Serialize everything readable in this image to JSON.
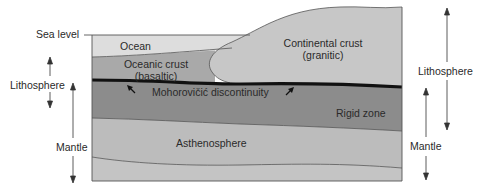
{
  "labels": {
    "sea_level": "Sea level",
    "ocean": "Ocean",
    "oceanic_crust_line1": "Oceanic crust",
    "oceanic_crust_line2": "(basaltic)",
    "continental_crust_line1": "Continental crust",
    "continental_crust_line2": "(granitic)",
    "moho": "Mohorovičić discontinuity",
    "rigid_zone": "Rigid zone",
    "asthenosphere": "Asthenosphere",
    "left_lithosphere": "Lithosphere",
    "left_mantle": "Mantle",
    "right_lithosphere": "Lithosphere",
    "right_mantle": "Mantle"
  },
  "colors": {
    "ocean": "#dcdcdc",
    "oceanic_crust": "#aaaaaa",
    "continental_crust": "#c6c6c6",
    "rigid_zone": "#8c8c8c",
    "asthenosphere": "#bdbdbd",
    "lower_mantle": "#c4c4c4",
    "moho_line": "#111111",
    "boundary_line": "#555555"
  }
}
